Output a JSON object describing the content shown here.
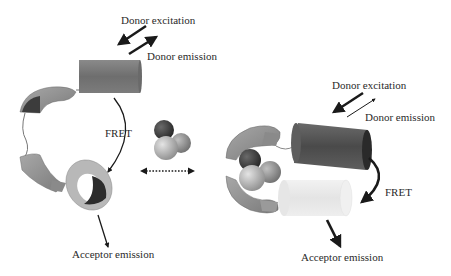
{
  "diagram": {
    "type": "FRET calcium sensor conformational change",
    "left_state": {
      "labels": {
        "donor_excitation": "Donor excitation",
        "donor_emission": "Donor emission",
        "fret": "FRET",
        "acceptor_emission": "Acceptor emission"
      }
    },
    "right_state": {
      "labels": {
        "donor_excitation": "Donor excitation",
        "donor_emission": "Donor emission",
        "fret": "FRET",
        "acceptor_emission": "Acceptor emission"
      }
    },
    "center": {
      "ion_cluster": "calcium-ions",
      "transition_arrow": "reversible-dotted-arrow"
    },
    "colors": {
      "donor_cylinder_left": "#7a7a7a",
      "donor_cylinder_right": "#555555",
      "acceptor_cylinder_left": "#b0b0b0",
      "acceptor_cylinder_right": "#ececec",
      "domain_shell": "#9a9a9a",
      "ion_dark": "#3a3a3a",
      "ion_light": "#c8c8c8",
      "arrow": "#1a1a1a",
      "text": "#2a2a2a"
    }
  }
}
